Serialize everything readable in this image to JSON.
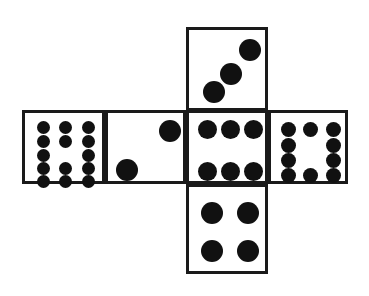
{
  "diagram": {
    "shape": "cross-net",
    "background_color": "#ffffff",
    "stroke_color": "#1a1a1a",
    "pip_color": "#111111",
    "stroke_width_px": 3,
    "canvas": {
      "width": 369,
      "height": 296
    }
  },
  "faces": [
    {
      "id": "top-face",
      "position_label": "top",
      "pip_count": 3,
      "pattern": "diagonal-ascending",
      "rect": {
        "x": 186,
        "y": 27,
        "w": 82,
        "h": 84
      },
      "pips": [
        {
          "cx": 25,
          "cy": 62,
          "r": 11
        },
        {
          "cx": 42,
          "cy": 44,
          "r": 11
        },
        {
          "cx": 61,
          "cy": 20,
          "r": 11
        }
      ]
    },
    {
      "id": "left-outer-face",
      "position_label": "left-outer",
      "pip_count": 14,
      "pattern": "grid-3x5-minus-center",
      "rect": {
        "x": 22,
        "y": 110,
        "w": 83,
        "h": 74
      },
      "pips": [
        {
          "cx": 18,
          "cy": 14,
          "r": 6.5
        },
        {
          "cx": 40,
          "cy": 14,
          "r": 6.5
        },
        {
          "cx": 63,
          "cy": 14,
          "r": 6.5
        },
        {
          "cx": 18,
          "cy": 28,
          "r": 6.5
        },
        {
          "cx": 40,
          "cy": 28,
          "r": 6.5
        },
        {
          "cx": 63,
          "cy": 28,
          "r": 6.5
        },
        {
          "cx": 18,
          "cy": 42,
          "r": 6.5
        },
        {
          "cx": 63,
          "cy": 42,
          "r": 6.5
        },
        {
          "cx": 18,
          "cy": 55,
          "r": 6.5
        },
        {
          "cx": 40,
          "cy": 55,
          "r": 6.5
        },
        {
          "cx": 63,
          "cy": 55,
          "r": 6.5
        },
        {
          "cx": 18,
          "cy": 68,
          "r": 6.5
        },
        {
          "cx": 40,
          "cy": 68,
          "r": 6.5
        },
        {
          "cx": 63,
          "cy": 68,
          "r": 6.5
        }
      ]
    },
    {
      "id": "left-inner-face",
      "position_label": "left-inner",
      "pip_count": 2,
      "pattern": "diagonal-two",
      "rect": {
        "x": 105,
        "y": 110,
        "w": 81,
        "h": 74
      },
      "pips": [
        {
          "cx": 19,
          "cy": 57,
          "r": 11
        },
        {
          "cx": 62,
          "cy": 18,
          "r": 11
        }
      ]
    },
    {
      "id": "center-face",
      "position_label": "center",
      "pip_count": 6,
      "pattern": "two-rows-of-three",
      "rect": {
        "x": 186,
        "y": 110,
        "w": 82,
        "h": 74
      },
      "pips": [
        {
          "cx": 18,
          "cy": 16,
          "r": 9.5
        },
        {
          "cx": 41,
          "cy": 16,
          "r": 9.5
        },
        {
          "cx": 64,
          "cy": 16,
          "r": 9.5
        },
        {
          "cx": 18,
          "cy": 58,
          "r": 9.5
        },
        {
          "cx": 41,
          "cy": 58,
          "r": 9.5
        },
        {
          "cx": 64,
          "cy": 58,
          "r": 9.5
        }
      ]
    },
    {
      "id": "right-face",
      "position_label": "right",
      "pip_count": 10,
      "pattern": "columns-4-2-4",
      "rect": {
        "x": 268,
        "y": 110,
        "w": 80,
        "h": 74
      },
      "pips": [
        {
          "cx": 17,
          "cy": 16,
          "r": 7.5
        },
        {
          "cx": 39,
          "cy": 16,
          "r": 7.5
        },
        {
          "cx": 62,
          "cy": 16,
          "r": 7.5
        },
        {
          "cx": 17,
          "cy": 32,
          "r": 7.5
        },
        {
          "cx": 62,
          "cy": 32,
          "r": 7.5
        },
        {
          "cx": 17,
          "cy": 47,
          "r": 7.5
        },
        {
          "cx": 62,
          "cy": 47,
          "r": 7.5
        },
        {
          "cx": 17,
          "cy": 62,
          "r": 7.5
        },
        {
          "cx": 39,
          "cy": 62,
          "r": 7.5
        },
        {
          "cx": 62,
          "cy": 62,
          "r": 7.5
        }
      ]
    },
    {
      "id": "bottom-face",
      "position_label": "bottom",
      "pip_count": 4,
      "pattern": "four-corners",
      "rect": {
        "x": 186,
        "y": 184,
        "w": 82,
        "h": 90
      },
      "pips": [
        {
          "cx": 23,
          "cy": 26,
          "r": 11
        },
        {
          "cx": 59,
          "cy": 26,
          "r": 11
        },
        {
          "cx": 23,
          "cy": 64,
          "r": 11
        },
        {
          "cx": 59,
          "cy": 64,
          "r": 11
        }
      ]
    }
  ]
}
